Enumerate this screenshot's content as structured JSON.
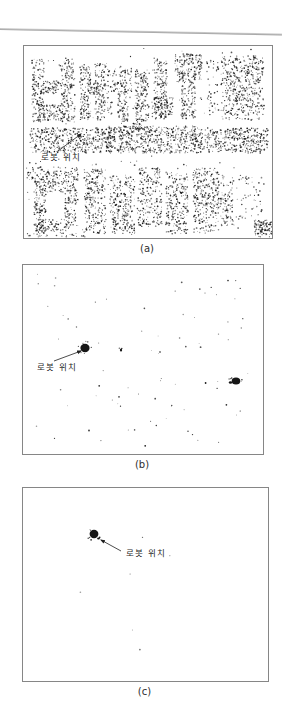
{
  "page": {
    "background": "#ffffff",
    "rule_color": "#9e9e9e",
    "frame_color": "#868686",
    "dot_color": "#161616",
    "text_color": "#1f1f1f",
    "caption_color": "#2e2e2e"
  },
  "annotation_label": "로봇 위치",
  "chart_data": [
    {
      "type": "scatter",
      "caption": "(a)",
      "frame": {
        "left": 23,
        "top": 45,
        "width": 248,
        "height": 192
      },
      "seed": 7,
      "regions": [
        [
          8,
          13,
          12,
          63,
          150
        ],
        [
          36,
          12,
          15,
          64,
          170
        ],
        [
          19,
          35,
          18,
          13,
          60
        ],
        [
          19,
          59,
          18,
          15,
          70
        ],
        [
          56,
          19,
          11,
          55,
          120
        ],
        [
          71,
          17,
          11,
          57,
          130
        ],
        [
          64,
          37,
          10,
          12,
          40
        ],
        [
          83,
          23,
          5,
          50,
          28
        ],
        [
          88,
          21,
          20,
          26,
          90
        ],
        [
          94,
          45,
          10,
          43,
          90
        ],
        [
          111,
          23,
          13,
          40,
          110
        ],
        [
          109,
          59,
          16,
          28,
          80
        ],
        [
          130,
          12,
          13,
          58,
          130
        ],
        [
          128,
          51,
          21,
          22,
          110
        ],
        [
          151,
          8,
          27,
          28,
          180
        ],
        [
          157,
          36,
          15,
          36,
          110
        ],
        [
          183,
          14,
          12,
          55,
          40
        ],
        [
          197,
          10,
          43,
          64,
          450
        ],
        [
          6,
          82,
          82,
          25,
          430
        ],
        [
          84,
          80,
          88,
          27,
          480
        ],
        [
          168,
          82,
          76,
          25,
          420
        ],
        [
          2,
          121,
          52,
          13,
          110
        ],
        [
          10,
          134,
          45,
          12,
          110
        ],
        [
          10,
          144,
          12,
          45,
          100
        ],
        [
          41,
          144,
          13,
          37,
          90
        ],
        [
          12,
          173,
          33,
          13,
          80
        ],
        [
          60,
          123,
          22,
          65,
          230
        ],
        [
          86,
          129,
          25,
          59,
          240
        ],
        [
          114,
          122,
          24,
          59,
          220
        ],
        [
          142,
          126,
          22,
          62,
          220
        ],
        [
          169,
          122,
          26,
          65,
          270
        ],
        [
          196,
          129,
          14,
          51,
          90
        ],
        [
          212,
          129,
          28,
          46,
          50
        ],
        [
          230,
          174,
          18,
          17,
          110
        ],
        [
          3,
          183,
          60,
          8,
          40
        ],
        [
          2,
          2,
          244,
          188,
          170
        ]
      ],
      "blobs": [],
      "annotation": {
        "text": "로봇 위치",
        "tx": 17,
        "ty": 114,
        "arrow": [
          34,
          105,
          57,
          88
        ]
      }
    },
    {
      "type": "scatter",
      "caption": "(b)",
      "frame": {
        "left": 22,
        "top": 264,
        "width": 240,
        "height": 189
      },
      "seed": 13,
      "regions": [
        [
          6,
          8,
          228,
          175,
          40
        ],
        [
          150,
          14,
          76,
          52,
          14
        ],
        [
          60,
          70,
          150,
          55,
          12
        ],
        [
          30,
          128,
          185,
          50,
          10
        ]
      ],
      "blobs": [
        {
          "cx": 62,
          "cy": 83,
          "rx": 4.6,
          "ry": 4.2,
          "sat": 7
        },
        {
          "cx": 213,
          "cy": 116,
          "rx": 4.3,
          "ry": 3.5,
          "sat": 6
        },
        {
          "cx": 207.5,
          "cy": 117.5,
          "rx": 1.7,
          "ry": 1.2,
          "sat": 0
        },
        {
          "cx": 98,
          "cy": 85,
          "rx": 1.1,
          "ry": 1.6,
          "sat": 2
        },
        {
          "cx": 137,
          "cy": 87,
          "rx": 0.8,
          "ry": 0.8,
          "sat": 1
        }
      ],
      "annotation": {
        "text": "로봇 위치",
        "tx": 14,
        "ty": 105,
        "arrow": [
          31,
          96,
          58,
          86
        ]
      }
    },
    {
      "type": "scatter",
      "caption": "(c)",
      "frame": {
        "left": 22,
        "top": 487,
        "width": 245,
        "height": 193
      },
      "seed": 21,
      "regions": [
        [
          12,
          10,
          220,
          170,
          6
        ]
      ],
      "blobs": [
        {
          "cx": 71,
          "cy": 46,
          "rx": 4.4,
          "ry": 4.2,
          "sat": 6
        },
        {
          "cx": 75.5,
          "cy": 50.5,
          "rx": 1.4,
          "ry": 1.1,
          "sat": 0
        }
      ],
      "annotation": {
        "text": "로봇 위치",
        "tx": 103,
        "ty": 68,
        "arrow": [
          98,
          63,
          78,
          52
        ]
      }
    }
  ]
}
